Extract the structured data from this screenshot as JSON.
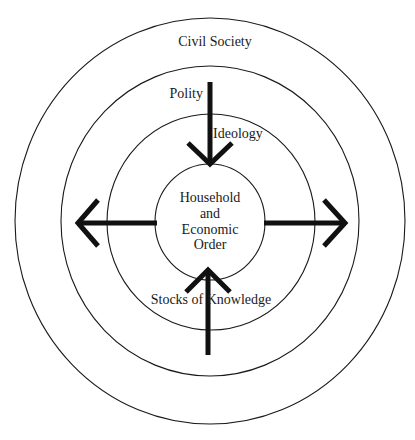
{
  "diagram": {
    "type": "concentric-circles",
    "colors": {
      "stroke": "#1a1a1a",
      "arrow": "#111111",
      "background": "#ffffff"
    },
    "rings": [
      {
        "id": "civil-society",
        "label": "Civil Society"
      },
      {
        "id": "polity",
        "label": "Polity"
      },
      {
        "id": "ideology",
        "label": "Ideology"
      },
      {
        "id": "household",
        "label_lines": [
          "Household",
          "and",
          "Economic",
          "Order"
        ]
      }
    ],
    "extra_labels": {
      "stocks_of_knowledge": "Stocks of Knowledge"
    },
    "arrows": [
      {
        "id": "down",
        "direction": "inward",
        "from": "Polity",
        "to": "Household and Economic Order"
      },
      {
        "id": "up",
        "direction": "inward",
        "from": "Stocks of Knowledge",
        "to": "Household and Economic Order"
      },
      {
        "id": "left",
        "direction": "outward",
        "from": "Household and Economic Order"
      },
      {
        "id": "right",
        "direction": "outward",
        "from": "Household and Economic Order"
      }
    ]
  }
}
